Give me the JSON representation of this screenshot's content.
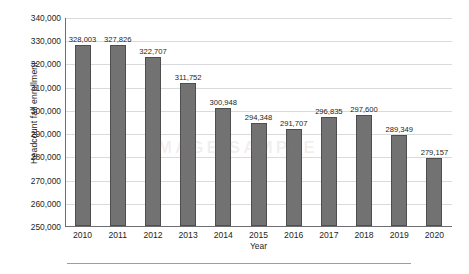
{
  "chart_data": {
    "type": "bar",
    "title": "",
    "xlabel": "Year",
    "ylabel": "Headcount fall enrollment",
    "categories": [
      "2010",
      "2011",
      "2012",
      "2013",
      "2014",
      "2015",
      "2016",
      "2017",
      "2018",
      "2019",
      "2020"
    ],
    "values": [
      328003,
      327826,
      322707,
      311752,
      300948,
      294348,
      291707,
      296835,
      297600,
      289349,
      279157
    ],
    "value_labels": [
      "328,003",
      "327,826",
      "322,707",
      "311,752",
      "300,948",
      "294,348",
      "291,707",
      "296,835",
      "297,600",
      "289,349",
      "279,157"
    ],
    "ylim": [
      250000,
      340000
    ],
    "ytick_values": [
      340000,
      330000,
      320000,
      310000,
      300000,
      290000,
      280000,
      270000,
      260000,
      250000
    ],
    "ytick_labels": [
      "340,000",
      "330,000",
      "320,000",
      "310,000",
      "300,000",
      "290,000",
      "280,000",
      "270,000",
      "260,000",
      "250,000"
    ],
    "grid": true,
    "legend": false,
    "bar_color": "#727272",
    "bar_border_color": "#4e4e4e",
    "grid_color": "#d9dadb",
    "axis_color": "#6d6e71",
    "text_color": "#231f20"
  },
  "watermark": {
    "text": "IMAGE SAMPLE"
  }
}
